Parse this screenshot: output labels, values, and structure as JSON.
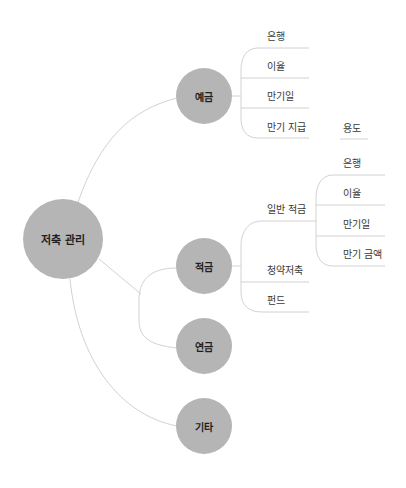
{
  "diagram": {
    "type": "mindmap",
    "colors": {
      "node_fill": "#b5b5b5",
      "node_text": "#1e1e1e",
      "leaf_text": "#3a3a3a",
      "connector": "#d2d2d2"
    },
    "root": {
      "label": "저축 관리"
    },
    "branches": [
      {
        "label": "예금",
        "children": [
          {
            "label": "은행"
          },
          {
            "label": "이율"
          },
          {
            "label": "만기일"
          },
          {
            "label": "만기 지급"
          }
        ]
      },
      {
        "label": "적금",
        "children": [
          {
            "label": "일반 적금",
            "children": [
              {
                "label": "은행"
              },
              {
                "label": "이율"
              },
              {
                "label": "만기일"
              },
              {
                "label": "만기 금액"
              }
            ]
          },
          {
            "label": "청약저축"
          },
          {
            "label": "펀드"
          }
        ]
      },
      {
        "label": "연금",
        "children": []
      },
      {
        "label": "기타",
        "children": []
      }
    ],
    "floating": [
      {
        "label": "용도"
      }
    ]
  }
}
